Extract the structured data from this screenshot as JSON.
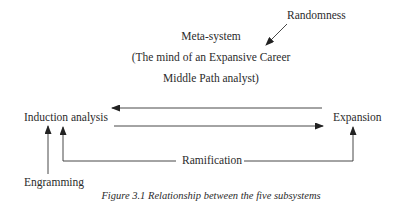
{
  "diagram": {
    "meta_system": {
      "title": "Meta-system",
      "line2": "(The mind of an Expansive Career",
      "line3": "Middle Path analyst)"
    },
    "nodes": {
      "randomness": "Randomness",
      "induction": "Induction analysis",
      "expansion": "Expansion",
      "ramification": "Ramification",
      "engramming": "Engramming"
    },
    "edges": [
      {
        "from": "Randomness",
        "to": "Meta-system",
        "kind": "diagonal-arrow"
      },
      {
        "from": "Expansion",
        "to": "Induction analysis",
        "kind": "arrow-left"
      },
      {
        "from": "Induction analysis",
        "to": "Expansion",
        "kind": "arrow-right"
      },
      {
        "from": "Engramming",
        "to": "Induction analysis",
        "kind": "arrow-up"
      },
      {
        "from": "Ramification",
        "to": "Induction analysis",
        "kind": "bracket-arrow-up"
      },
      {
        "from": "Ramification",
        "to": "Expansion",
        "kind": "bracket-arrow-up"
      }
    ],
    "caption": "Figure 3.1 Relationship between the five subsystems",
    "colors": {
      "line": "#333333",
      "text": "#2b2b2b",
      "background": "#ffffff"
    }
  }
}
